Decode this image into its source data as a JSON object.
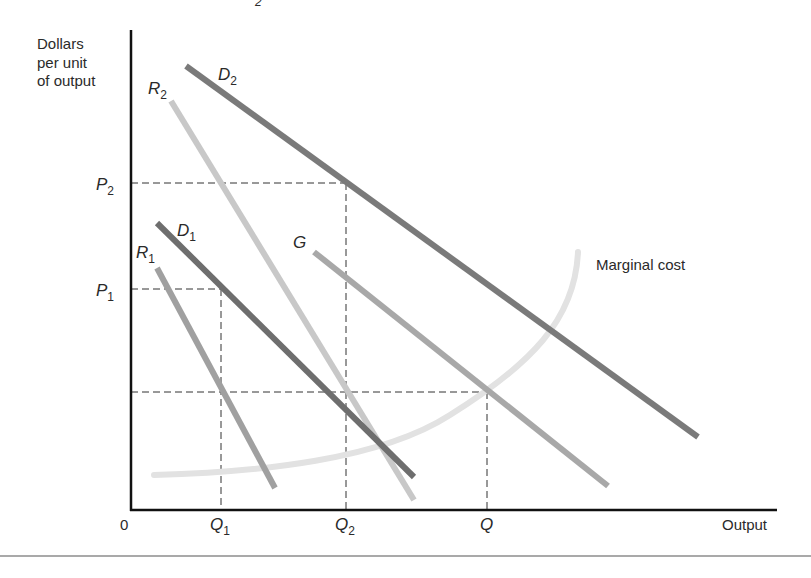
{
  "diagram": {
    "title_fragment": "2",
    "y_axis_label": [
      "Dollars",
      "per unit",
      "of output"
    ],
    "x_axis_label": "Output",
    "origin_label": "0",
    "price_ticks": [
      {
        "main": "P",
        "sub": "2",
        "y": 183
      },
      {
        "main": "P",
        "sub": "1",
        "y": 289
      }
    ],
    "quantity_ticks": [
      {
        "main": "Q",
        "sub": "1",
        "x": 221
      },
      {
        "main": "Q",
        "sub": "2",
        "x": 346
      },
      {
        "main": "Q",
        "sub": "",
        "x": 487
      }
    ],
    "curves": [
      {
        "id": "D2",
        "main": "D",
        "sub": "2",
        "color": "#7a7a7a",
        "x1": 186,
        "y1": 66,
        "x2": 698,
        "y2": 437
      },
      {
        "id": "R2",
        "main": "R",
        "sub": "2",
        "color": "#c8c8c8",
        "x1": 171,
        "y1": 101,
        "x2": 414,
        "y2": 500
      },
      {
        "id": "D1",
        "main": "D",
        "sub": "1",
        "color": "#6e6e6e",
        "x1": 157,
        "y1": 223,
        "x2": 414,
        "y2": 477
      },
      {
        "id": "R1",
        "main": "R",
        "sub": "1",
        "color": "#a0a0a0",
        "x1": 157,
        "y1": 268,
        "x2": 275,
        "y2": 488
      },
      {
        "id": "G",
        "main": "G",
        "sub": "",
        "color": "#a8a8a8",
        "x1": 314,
        "y1": 252,
        "x2": 608,
        "y2": 486
      }
    ],
    "marginal_cost": {
      "label": "Marginal cost",
      "color": "#e2e2e2"
    },
    "guide_y_Q": 392
  }
}
